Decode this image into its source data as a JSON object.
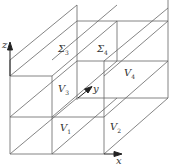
{
  "diagram": {
    "type": "3d-domain-decomposition",
    "axes": {
      "x": "x",
      "y": "y",
      "z": "z"
    },
    "regions": [
      {
        "id": "V1",
        "base": "V",
        "sub": "1"
      },
      {
        "id": "V2",
        "base": "V",
        "sub": "2"
      },
      {
        "id": "V3",
        "base": "V",
        "sub": "3"
      },
      {
        "id": "V4",
        "base": "V",
        "sub": "4"
      }
    ],
    "interfaces": [
      {
        "id": "S3",
        "base": "Σ",
        "sub": "3"
      },
      {
        "id": "S4",
        "base": "Σ",
        "sub": "4"
      }
    ],
    "colors": {
      "line": "#555555",
      "background": "#ffffff",
      "text": "#333333"
    }
  }
}
